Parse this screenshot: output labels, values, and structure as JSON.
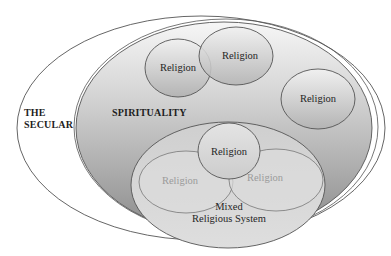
{
  "diagram": {
    "title": "",
    "colors": {
      "background": "#ffffff",
      "stroke": "#555555",
      "spirituality_gradient_top": "#f3f3f3",
      "spirituality_gradient_bottom": "#8e8e8e",
      "religion_fill_top": "#eeeeee",
      "religion_fill_bottom": "#b8b8b8",
      "mixed_fill": "#d6d6d6",
      "faded_text": "#9a9a9a"
    },
    "regions": {
      "secular": {
        "label_line1": "THE",
        "label_line2": "SECULAR"
      },
      "spirituality": {
        "label": "SPIRITUALITY"
      },
      "religions": [
        {
          "label": "Religion"
        },
        {
          "label": "Religion"
        },
        {
          "label": "Religion"
        }
      ],
      "mixed_system": {
        "label_line1": "Mixed",
        "label_line2": "Religious System",
        "religions": [
          {
            "label": "Religion",
            "faded": false
          },
          {
            "label": "Religion",
            "faded": true
          },
          {
            "label": "Religion",
            "faded": true
          }
        ]
      }
    }
  }
}
